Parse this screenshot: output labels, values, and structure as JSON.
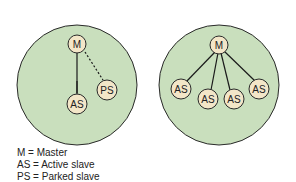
{
  "colors": {
    "piconet_fill": "#c9dfbd",
    "piconet_stroke": "#2a2a2a",
    "node_fill": "#f3e6c8",
    "node_stroke": "#2a2a2a",
    "line": "#1a1a1a"
  },
  "piconets": [
    {
      "master": "M",
      "active_slaves": [
        "AS"
      ],
      "parked_slaves": [
        "PS"
      ]
    },
    {
      "master": "M",
      "active_slaves": [
        "AS",
        "AS",
        "AS",
        "AS"
      ],
      "parked_slaves": []
    }
  ],
  "labels": {
    "left_master": "M",
    "left_active": "AS",
    "left_parked": "PS",
    "right_master": "M",
    "right_as1": "AS",
    "right_as2": "AS",
    "right_as3": "AS",
    "right_as4": "AS"
  },
  "legend": [
    "M = Master",
    "AS = Active slave",
    "PS = Parked slave"
  ]
}
